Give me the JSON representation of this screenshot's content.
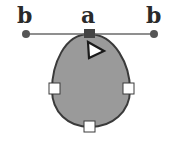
{
  "labels": {
    "left_anchor": "b",
    "center_anchor": "a",
    "right_anchor": "b"
  },
  "colors": {
    "shape_fill": "#9a9a9a",
    "shape_stroke": "#3a3a3a",
    "line": "#6a6a6a",
    "anchor_dot": "#555555",
    "handle_fill": "#ffffff",
    "selected_anchor": "#444444"
  },
  "icons": {
    "cursor": "arrow-pointer-icon"
  }
}
